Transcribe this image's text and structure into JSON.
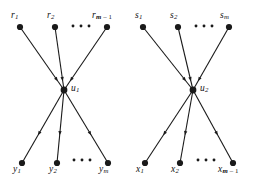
{
  "figure": {
    "background_color": "#ffffff",
    "ink_color": "#1a1a1a"
  },
  "left_graph": {
    "hub": {
      "id": "u1",
      "label_base": "u",
      "label_sub": "1",
      "x": 64,
      "y": 90
    },
    "in_nodes": [
      {
        "id": "r1",
        "label_base": "r",
        "label_sub": "1",
        "x": 20,
        "y": 27,
        "label_x": 11,
        "label_y": 11
      },
      {
        "id": "r2",
        "label_base": "r",
        "label_sub": "2",
        "x": 55,
        "y": 27,
        "label_x": 47,
        "label_y": 11
      },
      {
        "id": "rm1",
        "label_base": "r",
        "label_sub": "m – 1",
        "x": 107,
        "y": 27,
        "label_x": 92,
        "label_y": 11
      }
    ],
    "out_nodes": [
      {
        "id": "y1",
        "label_base": "y",
        "label_sub": "1",
        "x": 22,
        "y": 163,
        "label_x": 13,
        "label_y": 165
      },
      {
        "id": "y2",
        "label_base": "y",
        "label_sub": "2",
        "x": 57,
        "y": 163,
        "label_x": 49,
        "label_y": 165
      },
      {
        "id": "ym",
        "label_base": "y",
        "label_sub": "m",
        "x": 108,
        "y": 163,
        "label_x": 99,
        "label_y": 165
      }
    ],
    "top_ellipsis": {
      "x": 73,
      "y": 26,
      "count": 3,
      "spacing": 8
    },
    "bottom_ellipsis": {
      "x": 74,
      "y": 160,
      "count": 3,
      "spacing": 8
    }
  },
  "right_graph": {
    "hub": {
      "id": "u2",
      "label_base": "u",
      "label_sub": "2",
      "x": 193,
      "y": 90
    },
    "in_nodes": [
      {
        "id": "s1",
        "label_base": "s",
        "label_sub": "1",
        "x": 143,
        "y": 27,
        "label_x": 135,
        "label_y": 11
      },
      {
        "id": "s2",
        "label_base": "s",
        "label_sub": "2",
        "x": 178,
        "y": 27,
        "label_x": 170,
        "label_y": 11
      },
      {
        "id": "sm",
        "label_base": "s",
        "label_sub": "m",
        "x": 229,
        "y": 27,
        "label_x": 220,
        "label_y": 11
      }
    ],
    "out_nodes": [
      {
        "id": "x1",
        "label_base": "x",
        "label_sub": "1",
        "x": 145,
        "y": 163,
        "label_x": 136,
        "label_y": 165
      },
      {
        "id": "x2",
        "label_base": "x",
        "label_sub": "2",
        "x": 180,
        "y": 163,
        "label_x": 171,
        "label_y": 165
      },
      {
        "id": "xm1",
        "label_base": "x",
        "label_sub": "m – 1",
        "x": 233,
        "y": 163,
        "label_x": 218,
        "label_y": 165
      }
    ],
    "top_ellipsis": {
      "x": 196,
      "y": 26,
      "count": 3,
      "spacing": 8
    },
    "bottom_ellipsis": {
      "x": 198,
      "y": 160,
      "count": 3,
      "spacing": 8
    }
  },
  "style_values": {
    "node_radius": 3.1,
    "hub_radius": 3.4,
    "edge_width": 1.1,
    "arrow_size": 4.2
  }
}
